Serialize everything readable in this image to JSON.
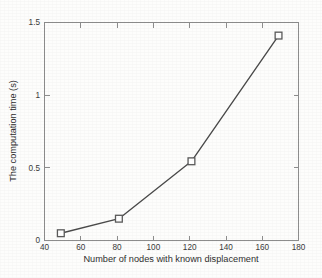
{
  "chart_data": {
    "type": "line",
    "title": "",
    "subtitle": "",
    "xlabel": "Number of nodes with known displacement",
    "ylabel": "The computation time (s)",
    "x": [
      49,
      81,
      121,
      169
    ],
    "values": [
      0.05,
      0.15,
      0.545,
      1.41
    ],
    "series": [
      {
        "name": "computation time",
        "x": [
          49,
          81,
          121,
          169
        ],
        "values": [
          0.05,
          0.15,
          0.545,
          1.41
        ],
        "marker": "square",
        "line_color": "#4a4a4a",
        "marker_face_color": "#ffffff",
        "marker_edge_color": "#5a5a5a"
      }
    ],
    "xlim": [
      40,
      180
    ],
    "ylim": [
      0,
      1.5
    ],
    "xticks": [
      40,
      60,
      80,
      100,
      120,
      140,
      160,
      180
    ],
    "xticklabels": [
      "40",
      "60",
      "80",
      "100",
      "120",
      "140",
      "160",
      "180"
    ],
    "yticks": [
      0,
      0.5,
      1,
      1.5
    ],
    "yticklabels": [
      "0",
      "0.5",
      "1",
      "1.5"
    ],
    "grid": false,
    "legend": null,
    "legend_position": "none",
    "annotations": [],
    "axis_color": "#8d8d8d",
    "background_color": "#fdfdfc"
  }
}
